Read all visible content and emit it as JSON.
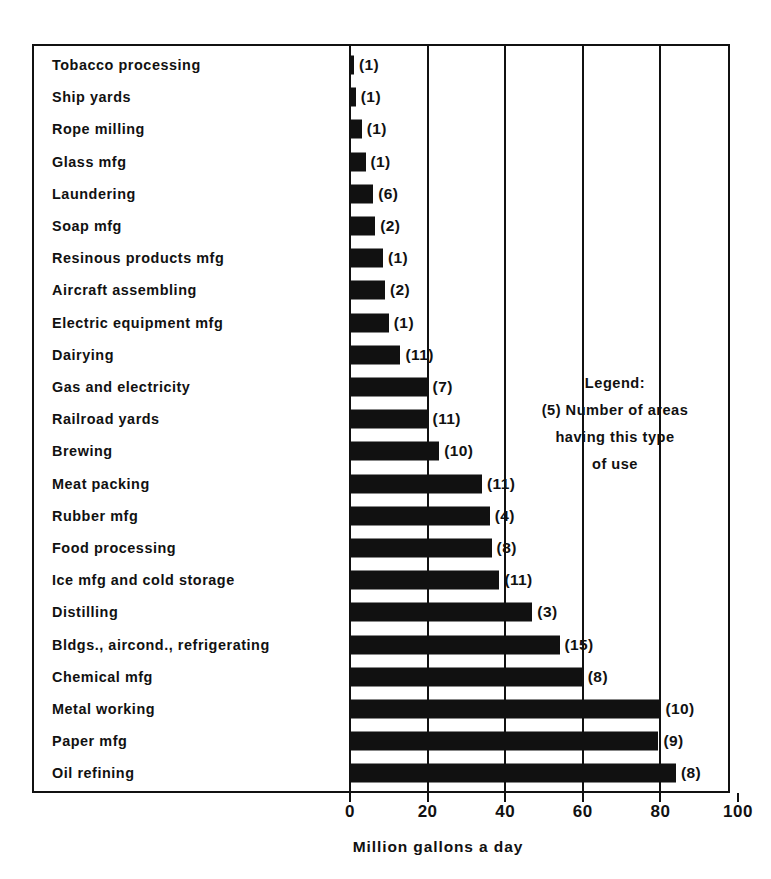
{
  "chart_data": {
    "type": "bar",
    "orientation": "horizontal",
    "title": "",
    "xlabel": "Million gallons a day",
    "ylabel": "",
    "xlim": [
      0,
      100
    ],
    "xticks": [
      0,
      20,
      40,
      60,
      80,
      100
    ],
    "xtick_labels": [
      "0",
      "20",
      "40",
      "60",
      "80",
      "100"
    ],
    "grid": true,
    "grid_axis": "x",
    "bar_color": "#111111",
    "background_color": "#ffffff",
    "legend_position": "inside-right",
    "categories": [
      "Tobacco processing",
      "Ship yards",
      "Rope milling",
      "Glass mfg",
      "Laundering",
      "Soap mfg",
      "Resinous products mfg",
      "Aircraft assembling",
      "Electric equipment mfg",
      "Dairying",
      "Gas and electricity",
      "Railroad yards",
      "Brewing",
      "Meat packing",
      "Rubber mfg",
      "Food processing",
      "Ice mfg and cold storage",
      "Distilling",
      "Bldgs., aircond., refrigerating",
      "Chemical mfg",
      "Metal working",
      "Paper mfg",
      "Oil refining"
    ],
    "values": [
      1,
      1.5,
      3,
      4,
      6,
      6.5,
      8.5,
      9,
      10,
      13,
      20,
      20,
      23,
      34,
      36,
      36.5,
      38.5,
      47,
      54,
      60,
      80,
      79.5,
      84
    ],
    "point_labels": [
      "(1)",
      "(1)",
      "(1)",
      "(1)",
      "(6)",
      "(2)",
      "(1)",
      "(2)",
      "(1)",
      "(11)",
      "(7)",
      "(11)",
      "(10)",
      "(11)",
      "(4)",
      "(8)",
      "(11)",
      "(3)",
      "(15)",
      "(8)",
      "(10)",
      "(9)",
      "(8)"
    ],
    "annotations": {
      "legend_lines": [
        "Legend:",
        "(5) Number of areas",
        "having this type",
        "of use"
      ]
    },
    "series": [
      {
        "name": "Water use",
        "values": [
          1,
          1.5,
          3,
          4,
          6,
          6.5,
          8.5,
          9,
          10,
          13,
          20,
          20,
          23,
          34,
          36,
          36.5,
          38.5,
          47,
          54,
          60,
          80,
          79.5,
          84
        ]
      }
    ],
    "area_counts": [
      1,
      1,
      1,
      1,
      6,
      2,
      1,
      2,
      1,
      11,
      7,
      11,
      10,
      11,
      4,
      8,
      11,
      3,
      15,
      8,
      10,
      9,
      8
    ]
  }
}
